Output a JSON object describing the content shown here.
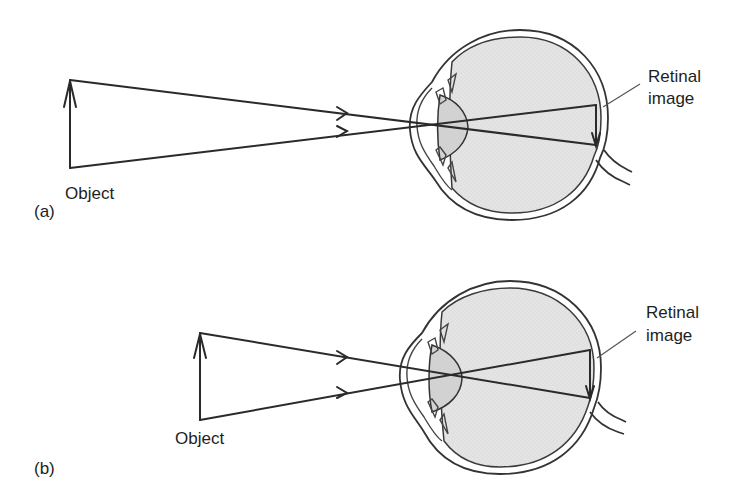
{
  "figure": {
    "colors": {
      "background": "#ffffff",
      "line": "#2a2a2a",
      "vitreous_fill": "#e3e3e3",
      "lens_fill": "#d4d4d4",
      "text": "#1e1e1e"
    },
    "panels": [
      {
        "id": "a",
        "panel_label": "(a)",
        "object_label": "Object",
        "retina_label_line1": "Retinal",
        "retina_label_line2": "image",
        "description": "Distant object: rays from object arrow cross at the lens and form a small inverted image on the retina"
      },
      {
        "id": "b",
        "panel_label": "(b)",
        "object_label": "Object",
        "retina_label_line1": "Retinal",
        "retina_label_line2": "image",
        "description": "Closer object: larger visual angle produces a larger inverted retinal image"
      }
    ]
  }
}
